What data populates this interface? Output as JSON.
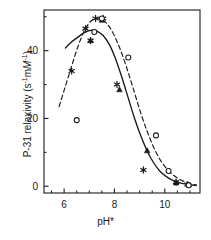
{
  "figure": {
    "background": "#ffffff",
    "foreground": "#1a1a1a"
  },
  "axes": {
    "ylabel_prefix": "P-31 relaxivity (s",
    "ylabel_sup1": "-1",
    "ylabel_mid": "m",
    "ylabel_ital": "M",
    "ylabel_sup2": "-1",
    "ylabel_suffix": ")",
    "xlabel": "pH*",
    "x_tick_labels": [
      "6",
      "8",
      "10"
    ],
    "y_tick_labels": [
      "0",
      "20",
      "40"
    ]
  },
  "chart_data": {
    "type": "scatter",
    "title": "",
    "xlabel": "pH*",
    "ylabel": "P-31 relaxivity (s^-1 mM^-1)",
    "xlim": [
      5.2,
      11.4
    ],
    "ylim": [
      -2,
      52
    ],
    "xticks": [
      6,
      8,
      10
    ],
    "yticks": [
      0,
      20,
      40
    ],
    "xminorticks": [
      5.5,
      6.5,
      7,
      7.5,
      8.5,
      9,
      9.5,
      10.5,
      11
    ],
    "yminorticks": [
      10,
      30,
      50
    ],
    "grid": false,
    "legend": false,
    "series": [
      {
        "name": "asterisk-series",
        "marker": "asterisk",
        "linestyle": "none",
        "color": "#1a1a1a",
        "x": [
          6.3,
          6.85,
          7.25,
          7.55,
          7.05,
          8.1,
          9.15,
          10.45,
          10.9
        ],
        "y": [
          34.0,
          46.5,
          49.5,
          49.5,
          43.0,
          30.0,
          4.8,
          1.2,
          0.5
        ]
      },
      {
        "name": "filled-triangle-series",
        "marker": "triangle",
        "linestyle": "none",
        "color": "#1a1a1a",
        "x": [
          7.05,
          7.5,
          8.2,
          9.3,
          10.45,
          10.95
        ],
        "y": [
          43.0,
          49.0,
          28.5,
          10.5,
          1.0,
          0.4
        ]
      },
      {
        "name": "open-circle-series",
        "marker": "circle-open",
        "linestyle": "none",
        "color": "#1a1a1a",
        "x": [
          6.5,
          7.2,
          7.5,
          8.55,
          9.65,
          10.15,
          10.95
        ],
        "y": [
          19.5,
          45.5,
          49.5,
          38.0,
          15.0,
          4.5,
          0.3
        ]
      },
      {
        "name": "solid-fit-curve",
        "marker": "none",
        "linestyle": "solid",
        "color": "#1a1a1a",
        "x": [
          6.05,
          6.3,
          6.55,
          6.8,
          7.05,
          7.3,
          7.55,
          7.8,
          8.05,
          8.3,
          8.55,
          8.8,
          9.05,
          9.3,
          9.55,
          9.8,
          10.05,
          10.3,
          10.6,
          10.95,
          11.25
        ],
        "y": [
          40.8,
          42.6,
          44.0,
          45.3,
          46.0,
          45.8,
          44.5,
          41.8,
          37.5,
          32.0,
          26.0,
          20.0,
          14.8,
          10.4,
          7.0,
          4.5,
          2.9,
          1.8,
          1.0,
          0.5,
          0.2
        ]
      },
      {
        "name": "dashed-fit-curve",
        "marker": "none",
        "linestyle": "dashed",
        "color": "#1a1a1a",
        "x": [
          5.8,
          6.05,
          6.3,
          6.55,
          6.8,
          7.05,
          7.3,
          7.55,
          7.8,
          8.05,
          8.3,
          8.55,
          8.8,
          9.05,
          9.3,
          9.55,
          9.8,
          10.05,
          10.3,
          10.6,
          10.95,
          11.25
        ],
        "y": [
          23.5,
          29.5,
          35.5,
          41.2,
          45.8,
          48.6,
          49.6,
          49.0,
          47.0,
          43.6,
          39.0,
          33.5,
          27.5,
          21.5,
          16.2,
          11.6,
          8.0,
          5.4,
          3.5,
          2.0,
          0.9,
          0.4
        ]
      }
    ],
    "annotations": []
  }
}
